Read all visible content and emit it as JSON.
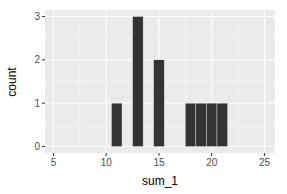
{
  "chart_data": {
    "type": "bar",
    "title": "",
    "xlabel": "sum_1",
    "ylabel": "count",
    "x": [
      11,
      13,
      15,
      18,
      19,
      20,
      21
    ],
    "values": [
      1,
      3,
      2,
      1,
      1,
      1,
      1
    ],
    "xlim": [
      4.2,
      26
    ],
    "ylim": [
      -0.15,
      3.15
    ],
    "xticks": [
      5,
      10,
      15,
      20,
      25
    ],
    "yticks": [
      0,
      1,
      2,
      3
    ],
    "grid": true,
    "bar_color": "#333333",
    "panel_background": "#ebebeb",
    "grid_color": "#ffffff"
  },
  "axes": {
    "x_title": "sum_1",
    "y_title": "count",
    "x_tick_labels": [
      "5",
      "10",
      "15",
      "20",
      "25"
    ],
    "y_tick_labels": [
      "0",
      "1",
      "2",
      "3"
    ]
  }
}
